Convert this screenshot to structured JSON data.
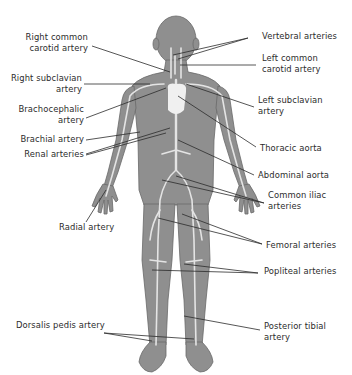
{
  "diagram": {
    "type": "anatomical-labeled-illustration",
    "colors": {
      "body_fill": "#8f8f8f",
      "body_outline": "#6a6a6a",
      "vessel": "#e4e4e4",
      "heart": "#f0f0f0",
      "leader_line": "#2b2b2b",
      "text": "#2b2b2b",
      "background": "#ffffff"
    },
    "labels_left": [
      {
        "id": "right-common-carotid",
        "text": "Right common\ncarotid artery"
      },
      {
        "id": "right-subclavian",
        "text": "Right subclavian\nartery"
      },
      {
        "id": "brachocephalic",
        "text": "Brachocephalic\nartery"
      },
      {
        "id": "brachial",
        "text": "Brachial artery"
      },
      {
        "id": "renal",
        "text": "Renal arteries"
      },
      {
        "id": "radial",
        "text": "Radial artery"
      },
      {
        "id": "dorsalis-pedis",
        "text": "Dorsalis pedis artery"
      }
    ],
    "labels_right": [
      {
        "id": "vertebral",
        "text": "Vertebral arteries"
      },
      {
        "id": "left-common-carotid",
        "text": "Left common\ncarotid artery"
      },
      {
        "id": "left-subclavian",
        "text": "Left subclavian\nartery"
      },
      {
        "id": "thoracic-aorta",
        "text": "Thoracic aorta"
      },
      {
        "id": "abdominal-aorta",
        "text": "Abdominal aorta"
      },
      {
        "id": "common-iliac",
        "text": "Common iliac\narteries"
      },
      {
        "id": "femoral",
        "text": "Femoral arteries"
      },
      {
        "id": "popliteal",
        "text": "Popliteal arteries"
      },
      {
        "id": "posterior-tibial",
        "text": "Posterior tibial\nartery"
      }
    ]
  }
}
